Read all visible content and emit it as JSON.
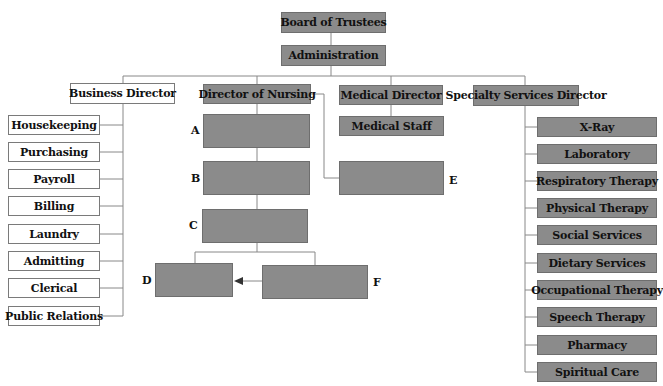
{
  "top": {
    "board": "Board of Trustees",
    "admin": "Administration"
  },
  "directors": {
    "business": "Business Director",
    "nursing": "Director of Nursing",
    "medical": "Medical Director",
    "specialty": "Specialty Services Director"
  },
  "medical_staff": "Medical Staff",
  "business_units": [
    "Housekeeping",
    "Purchasing",
    "Payroll",
    "Billing",
    "Laundry",
    "Admitting",
    "Clerical",
    "Public Relations"
  ],
  "specialty_units": [
    "X-Ray",
    "Laboratory",
    "Respiratory Therapy",
    "Physical Therapy",
    "Social Services",
    "Dietary Services",
    "Occupational Therapy",
    "Speech Therapy",
    "Pharmacy",
    "Spiritual Care"
  ],
  "blank_labels": {
    "a": "A",
    "b": "B",
    "c": "C",
    "d": "D",
    "e": "E",
    "f": "F"
  },
  "colors": {
    "box_fill": "#8b8b8b",
    "line": "#888888"
  }
}
